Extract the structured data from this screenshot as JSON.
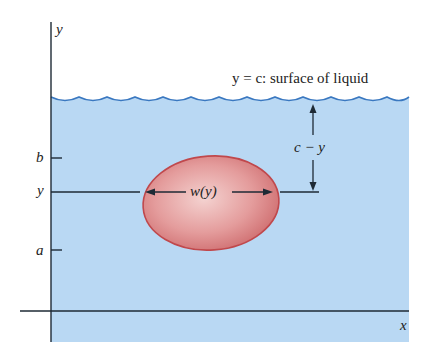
{
  "diagram": {
    "axes": {
      "x_label": "x",
      "y_label": "y"
    },
    "surface_label": "y = c: surface of liquid",
    "ticks": [
      {
        "label": "b"
      },
      {
        "label": "y"
      },
      {
        "label": "a"
      }
    ],
    "width_label": "w(y)",
    "depth_label": "c − y",
    "colors": {
      "liquid": "#b9d8f3",
      "wave": "#3a78c0",
      "plate_fill": "#e59a9a",
      "plate_edge": "#c0484c",
      "axis": "#1e2a35"
    }
  }
}
